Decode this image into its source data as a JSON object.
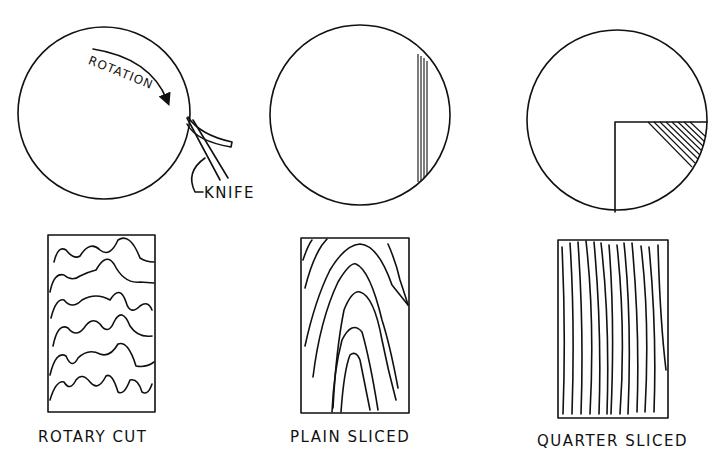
{
  "panels": [
    {
      "id": "rotary",
      "caption": "ROTARY CUT",
      "annotations": {
        "rotation": "ROTATION",
        "knife": "KNIFE"
      }
    },
    {
      "id": "plain",
      "caption": "PLAIN SLICED"
    },
    {
      "id": "quarter",
      "caption": "QUARTER SLICED"
    }
  ],
  "colors": {
    "ink": "#111111",
    "paper": "#ffffff"
  }
}
